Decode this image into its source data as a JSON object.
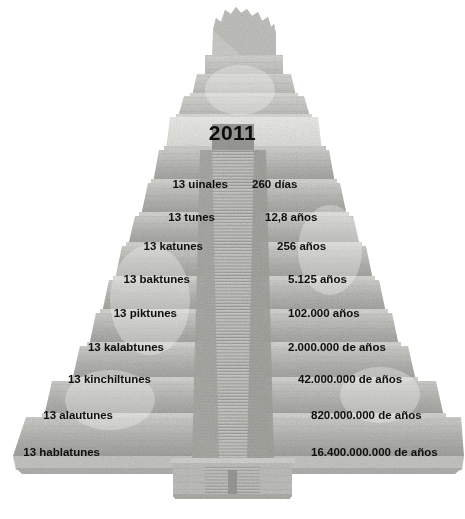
{
  "figure": {
    "title_year": "2011",
    "background_color": "#ffffff",
    "text_color": "#0f0f0f",
    "stone_light": "#d8d8d6",
    "stone_mid": "#b9b9b6",
    "stone_dark": "#9d9d9a"
  },
  "rows": [
    {
      "unit": "13 uinales",
      "duration": "260 días",
      "unit_right": 228,
      "dur_left": 252,
      "top": 176
    },
    {
      "unit": "13 tunes",
      "duration": "12,8 años",
      "unit_right": 215,
      "dur_left": 265,
      "top": 209
    },
    {
      "unit": "13 katunes",
      "duration": "256 años",
      "unit_right": 203,
      "dur_left": 277,
      "top": 238
    },
    {
      "unit": "13 baktunes",
      "duration": "5.125 años",
      "unit_right": 190,
      "dur_left": 288,
      "top": 271
    },
    {
      "unit": "13 piktunes",
      "duration": "102.000 años",
      "unit_right": 177,
      "dur_left": 288,
      "top": 305
    },
    {
      "unit": "13 kalabtunes",
      "duration": "2.000.000 de años",
      "unit_right": 164,
      "dur_left": 288,
      "top": 339
    },
    {
      "unit": "13 kinchiltunes",
      "duration": "42.000.000 de años",
      "unit_right": 151,
      "dur_left": 298,
      "top": 371
    },
    {
      "unit": "13 alautunes",
      "duration": "820.000.000 de años",
      "unit_right": 113,
      "dur_left": 311,
      "top": 407
    },
    {
      "unit": "13 hablatunes",
      "duration": "16.400.000.000 de años",
      "unit_right": 100,
      "dur_left": 311,
      "top": 444
    }
  ]
}
